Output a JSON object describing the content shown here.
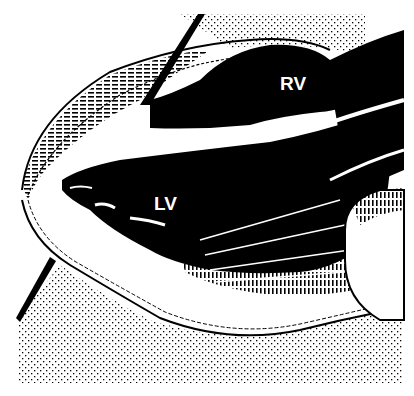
{
  "figure": {
    "type": "anatomical-illustration",
    "labels": {
      "right_ventricle": "RV",
      "left_ventricle": "LV"
    },
    "caption_visible": "",
    "colors": {
      "ink": "#000000",
      "paper": "#ffffff"
    }
  }
}
